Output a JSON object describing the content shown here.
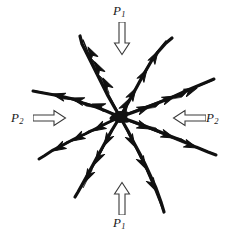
{
  "figure": {
    "type": "diagram",
    "background_color": "#ffffff",
    "ink_color": "#111111",
    "outline_arrow_color": "#3a3a3a",
    "center": {
      "x": 120,
      "y": 117
    }
  },
  "labels": {
    "p1_top": {
      "symbol": "P",
      "subscript": "1"
    },
    "p1_bottom": {
      "symbol": "P",
      "subscript": "1"
    },
    "p2_left": {
      "symbol": "P",
      "subscript": "2"
    },
    "p2_right": {
      "symbol": "P",
      "subscript": "2"
    }
  },
  "load_arrows": [
    {
      "name": "load-arrow-top",
      "direction": "down",
      "label": "P1",
      "glyph": "downwards-double-arrow"
    },
    {
      "name": "load-arrow-bottom",
      "direction": "up",
      "label": "P1",
      "glyph": "upwards-double-arrow"
    },
    {
      "name": "load-arrow-left",
      "direction": "right",
      "label": "P2",
      "glyph": "rightwards-double-arrow"
    },
    {
      "name": "load-arrow-right",
      "direction": "left",
      "label": "P2",
      "glyph": "leftwards-double-arrow"
    }
  ],
  "cracks": {
    "count": 8,
    "description": "Eight jagged crack branches radiating from a common center, each carrying small solid arrowheads pointing outward away from the center.",
    "branches": [
      {
        "id": 1,
        "angle_deg": 62,
        "length": 105,
        "end": {
          "x": 82,
          "y": 36
        },
        "arrowheads": 4
      },
      {
        "id": 2,
        "angle_deg": 118,
        "length": 110,
        "end": {
          "x": 172,
          "y": 42
        },
        "arrowheads": 4
      },
      {
        "id": 3,
        "angle_deg": 160,
        "length": 105,
        "end": {
          "x": 35,
          "y": 92
        },
        "arrowheads": 4
      },
      {
        "id": 4,
        "angle_deg": 20,
        "length": 108,
        "end": {
          "x": 214,
          "y": 79
        },
        "arrowheads": 4
      },
      {
        "id": 5,
        "angle_deg": 200,
        "length": 98,
        "end": {
          "x": 40,
          "y": 160
        },
        "arrowheads": 4
      },
      {
        "id": 6,
        "angle_deg": 340,
        "length": 108,
        "end": {
          "x": 216,
          "y": 156
        },
        "arrowheads": 4
      },
      {
        "id": 7,
        "angle_deg": 250,
        "length": 100,
        "end": {
          "x": 76,
          "y": 196
        },
        "arrowheads": 4
      },
      {
        "id": 8,
        "angle_deg": 290,
        "length": 110,
        "end": {
          "x": 162,
          "y": 212
        },
        "arrowheads": 4
      }
    ]
  }
}
